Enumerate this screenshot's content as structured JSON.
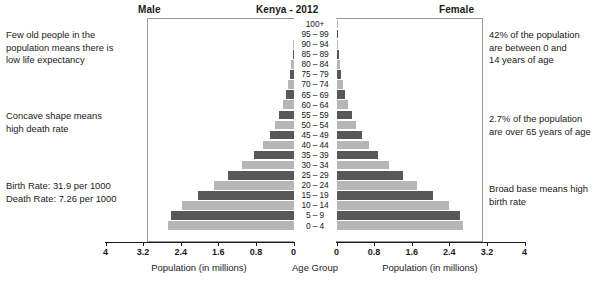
{
  "header": {
    "male_label": "Male",
    "title": "Kenya - 2012",
    "female_label": "Female"
  },
  "axis": {
    "left_caption": "Population (in millions)",
    "center_caption": "Age Group",
    "right_caption": "Population (in millions)",
    "left_ticks": [
      "4",
      "3.2",
      "2.4",
      "1.6",
      "0.8",
      "0"
    ],
    "right_ticks": [
      "0",
      "0.8",
      "1.6",
      "2.4",
      "3.2",
      "4"
    ],
    "max": 4,
    "tick_step": 0.8
  },
  "annotations": {
    "top_left": [
      "Few old people in the",
      "population means there is",
      "low life expectancy"
    ],
    "middle_left": [
      "Concave shape means",
      "high death rate"
    ],
    "bottom_left": [
      "Birth Rate: 31.9 per 1000",
      "Death Rate: 7.26 per 1000"
    ],
    "top_right": [
      "42% of the population",
      "are between 0 and",
      "14 years of age"
    ],
    "middle_right": [
      "2.7% of the population",
      "are over 65 years of age"
    ],
    "bottom_right": [
      "Broad base means high",
      "birth rate"
    ]
  },
  "colors": {
    "bar_dark": "#585858",
    "bar_light": "#b6b6b6",
    "frame": "#9a9a9a",
    "text": "#1a1a1a"
  },
  "chart_data": {
    "type": "bar",
    "subtype": "population-pyramid",
    "title": "Kenya - 2012",
    "xlabel": "Population (in millions)",
    "ylabel": "Age Group",
    "xlim": [
      0,
      4
    ],
    "grid": false,
    "legend": "none",
    "categories": [
      "100+",
      "95 – 99",
      "90 – 94",
      "85 – 89",
      "80 – 84",
      "75 – 79",
      "70 – 74",
      "65 – 69",
      "60 – 64",
      "55 – 59",
      "50 – 54",
      "45 – 49",
      "40 – 44",
      "35 – 39",
      "30 – 34",
      "25 – 29",
      "20 – 24",
      "15 – 19",
      "10 – 14",
      "5 – 9",
      "0 – 4"
    ],
    "series": [
      {
        "name": "Male",
        "side": "left",
        "values": [
          0.005,
          0.01,
          0.02,
          0.04,
          0.07,
          0.11,
          0.16,
          0.22,
          0.3,
          0.4,
          0.52,
          0.67,
          0.86,
          1.1,
          1.42,
          1.8,
          2.19,
          2.62,
          3.06,
          3.36,
          3.45
        ]
      },
      {
        "name": "Female",
        "side": "right",
        "values": [
          0.006,
          0.012,
          0.025,
          0.045,
          0.075,
          0.115,
          0.17,
          0.23,
          0.31,
          0.41,
          0.53,
          0.68,
          0.87,
          1.11,
          1.43,
          1.81,
          2.2,
          2.63,
          3.07,
          3.37,
          3.46
        ]
      }
    ]
  }
}
